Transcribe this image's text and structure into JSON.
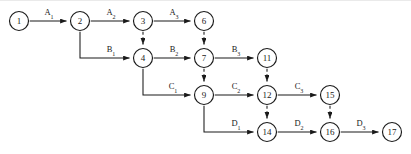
{
  "diagram": {
    "type": "directed-network",
    "canvas": {
      "width": 411,
      "height": 154
    },
    "style": {
      "node_fill": "#ffffff",
      "node_stroke": "#1a1a1a",
      "edge_color": "#1a1a1a",
      "background": "#ffffff",
      "node_radius": 9.5
    },
    "nodes": [
      {
        "id": "n1",
        "label": "1",
        "x": 19,
        "y": 21
      },
      {
        "id": "n2",
        "label": "2",
        "x": 80,
        "y": 21
      },
      {
        "id": "n3",
        "label": "3",
        "x": 143,
        "y": 21
      },
      {
        "id": "n6",
        "label": "6",
        "x": 204,
        "y": 21
      },
      {
        "id": "n4",
        "label": "4",
        "x": 143,
        "y": 58
      },
      {
        "id": "n7",
        "label": "7",
        "x": 204,
        "y": 58
      },
      {
        "id": "n11",
        "label": "11",
        "x": 267,
        "y": 58
      },
      {
        "id": "n9",
        "label": "9",
        "x": 204,
        "y": 95
      },
      {
        "id": "n12",
        "label": "12",
        "x": 267,
        "y": 95
      },
      {
        "id": "n15",
        "label": "15",
        "x": 330,
        "y": 95
      },
      {
        "id": "n14",
        "label": "14",
        "x": 267,
        "y": 132
      },
      {
        "id": "n16",
        "label": "16",
        "x": 330,
        "y": 132
      },
      {
        "id": "n17",
        "label": "17",
        "x": 392,
        "y": 132
      }
    ],
    "edges": [
      {
        "id": "e-a1",
        "from": "n1",
        "to": "n2",
        "style": "solid",
        "label_base": "A",
        "label_sub": "1",
        "label_x": 49,
        "label_y": 15
      },
      {
        "id": "e-a2",
        "from": "n2",
        "to": "n3",
        "style": "solid",
        "label_base": "A",
        "label_sub": "2",
        "label_x": 111,
        "label_y": 15
      },
      {
        "id": "e-a3",
        "from": "n3",
        "to": "n6",
        "style": "solid",
        "label_base": "A",
        "label_sub": "3",
        "label_x": 174,
        "label_y": 15
      },
      {
        "id": "e-b1",
        "from": "n2",
        "to": "n4",
        "style": "solid",
        "label_base": "B",
        "label_sub": "1",
        "label_x": 111,
        "label_y": 52
      },
      {
        "id": "e-b2",
        "from": "n4",
        "to": "n7",
        "style": "solid",
        "label_base": "B",
        "label_sub": "2",
        "label_x": 174,
        "label_y": 52
      },
      {
        "id": "e-b3",
        "from": "n7",
        "to": "n11",
        "style": "solid",
        "label_base": "B",
        "label_sub": "3",
        "label_x": 236,
        "label_y": 52
      },
      {
        "id": "e-c1",
        "from": "n4",
        "to": "n9",
        "style": "solid",
        "label_base": "C",
        "label_sub": "1",
        "label_x": 173,
        "label_y": 89
      },
      {
        "id": "e-c2",
        "from": "n9",
        "to": "n12",
        "style": "solid",
        "label_base": "C",
        "label_sub": "2",
        "label_x": 236,
        "label_y": 89
      },
      {
        "id": "e-c3",
        "from": "n12",
        "to": "n15",
        "style": "solid",
        "label_base": "C",
        "label_sub": "3",
        "label_x": 299,
        "label_y": 89
      },
      {
        "id": "e-d1",
        "from": "n9",
        "to": "n14",
        "style": "solid",
        "label_base": "D",
        "label_sub": "1",
        "label_x": 236,
        "label_y": 126
      },
      {
        "id": "e-d2",
        "from": "n14",
        "to": "n16",
        "style": "solid",
        "label_base": "D",
        "label_sub": "2",
        "label_x": 299,
        "label_y": 126
      },
      {
        "id": "e-d3",
        "from": "n16",
        "to": "n17",
        "style": "solid",
        "label_base": "D",
        "label_sub": "3",
        "label_x": 361,
        "label_y": 126
      },
      {
        "id": "e-dep-3-4",
        "from": "n3",
        "to": "n4",
        "style": "dashed",
        "label_base": "",
        "label_sub": ""
      },
      {
        "id": "e-dep-6-7",
        "from": "n6",
        "to": "n7",
        "style": "dashed",
        "label_base": "",
        "label_sub": ""
      },
      {
        "id": "e-dep-7-9",
        "from": "n7",
        "to": "n9",
        "style": "dashed",
        "label_base": "",
        "label_sub": ""
      },
      {
        "id": "e-dep-11-12",
        "from": "n11",
        "to": "n12",
        "style": "dashed",
        "label_base": "",
        "label_sub": ""
      },
      {
        "id": "e-dep-12-14",
        "from": "n12",
        "to": "n14",
        "style": "dashed",
        "label_base": "",
        "label_sub": ""
      },
      {
        "id": "e-dep-15-16",
        "from": "n15",
        "to": "n16",
        "style": "dashed",
        "label_base": "",
        "label_sub": ""
      }
    ]
  }
}
